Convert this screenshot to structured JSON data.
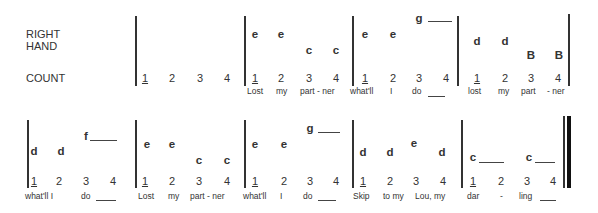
{
  "labels": {
    "right_hand_line1": "RIGHT",
    "right_hand_line2": "HAND",
    "count": "COUNT"
  },
  "rows": [
    {
      "measures": [
        {
          "notes": [],
          "counts": [
            "1",
            "2",
            "3",
            "4"
          ],
          "lyrics": []
        },
        {
          "notes": [
            "e",
            "e",
            "c",
            "c"
          ],
          "counts": [
            "1",
            "2",
            "3",
            "4"
          ],
          "lyrics": [
            "Lost",
            "my",
            "part - ner"
          ]
        },
        {
          "notes": [
            "e",
            "e",
            "g"
          ],
          "counts": [
            "1",
            "2",
            "3",
            "4"
          ],
          "lyrics": [
            "what'll",
            "I",
            "do"
          ]
        },
        {
          "notes": [
            "d",
            "d",
            "B",
            "B"
          ],
          "counts": [
            "1",
            "2",
            "3",
            "4"
          ],
          "lyrics": [
            "lost",
            "my",
            "part",
            "- ner"
          ]
        }
      ]
    },
    {
      "measures": [
        {
          "notes": [
            "d",
            "d",
            "f"
          ],
          "counts": [
            "1",
            "2",
            "3",
            "4"
          ],
          "lyrics": [
            "what'll I",
            "do"
          ]
        },
        {
          "notes": [
            "e",
            "e",
            "c",
            "c"
          ],
          "counts": [
            "1",
            "2",
            "3",
            "4"
          ],
          "lyrics": [
            "Lost",
            "my",
            "part - ner"
          ]
        },
        {
          "notes": [
            "e",
            "e",
            "g"
          ],
          "counts": [
            "1",
            "2",
            "3",
            "4"
          ],
          "lyrics": [
            "what'll",
            "I",
            "do"
          ]
        },
        {
          "notes": [
            "d",
            "d",
            "e",
            "d"
          ],
          "counts": [
            "1",
            "2",
            "3",
            "4"
          ],
          "lyrics": [
            "Skip",
            "to my",
            "Lou, my"
          ]
        },
        {
          "notes": [
            "c",
            "c"
          ],
          "counts": [
            "1",
            "2",
            "3",
            "4"
          ],
          "lyrics": [
            "dar",
            "-",
            "ling"
          ]
        }
      ]
    }
  ]
}
